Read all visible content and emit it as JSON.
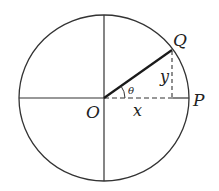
{
  "diagram": {
    "colors": {
      "stroke": "#333333",
      "radius": "#1a1a1a",
      "background": "#ffffff"
    },
    "labels": {
      "origin": "O",
      "point_q": "Q",
      "point_p": "P",
      "x_leg": "x",
      "y_leg": "y",
      "angle": "θ"
    }
  }
}
